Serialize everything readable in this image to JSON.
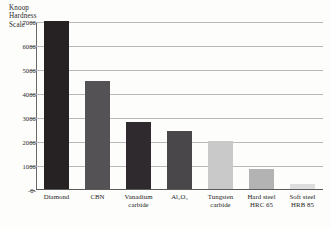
{
  "chart_data": {
    "type": "bar",
    "title": "Knoop Hardness Scale",
    "title_lines": [
      "Knoop",
      "Hardness",
      "Scale"
    ],
    "xlabel": "",
    "ylabel": "Knoop Hardness Scale",
    "ylim": [
      0,
      7000
    ],
    "yticks": [
      7000,
      6000,
      5000,
      4000,
      3000,
      2000,
      1000,
      0
    ],
    "ytick_labels": [
      "7000",
      "6000",
      "5000",
      "4000",
      "3000",
      "2000",
      "1000",
      "-0-"
    ],
    "grid": true,
    "legend": "none",
    "categories": [
      "Diamond",
      "CBN",
      "Vanadium carbide",
      "Al2O3",
      "Tungsten carbide",
      "Hard steel HRC 65",
      "Soft steel HRB 85"
    ],
    "category_lines": [
      [
        "Diamond",
        ""
      ],
      [
        "CBN",
        ""
      ],
      [
        "Vanadium",
        "carbide"
      ],
      [
        "Al₂O₃",
        ""
      ],
      [
        "Tungsten",
        "carbide"
      ],
      [
        "Hard steel",
        "HRC 65"
      ],
      [
        "Soft steel",
        "HRB 85"
      ]
    ],
    "values": [
      7000,
      4500,
      2800,
      2400,
      2000,
      850,
      200
    ],
    "bar_colors": [
      "#262123",
      "#555255",
      "#2f2a2d",
      "#4a474b",
      "#c9c9c9",
      "#b3b3b3",
      "#dedede"
    ]
  },
  "colors": {
    "background": "#fdfdfc",
    "grid": "#b9b9b9",
    "axis": "#6a6a6a",
    "text": "#232323"
  }
}
